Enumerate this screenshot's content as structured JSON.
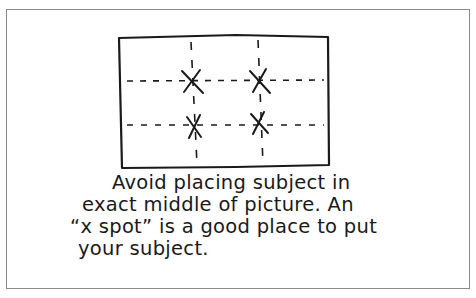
{
  "diagram": {
    "grid_label": "x spot markers",
    "markers": [
      {
        "x": 190,
        "y": 82
      },
      {
        "x": 259,
        "y": 81
      },
      {
        "x": 194,
        "y": 126
      },
      {
        "x": 259,
        "y": 124
      }
    ]
  },
  "caption": {
    "line1": "Avoid placing subject  in",
    "line2": "exact middle of picture. An",
    "line3": "“x spot” is a good place to put",
    "line4": "your subject."
  },
  "colors": {
    "ink": "#1a1a1a",
    "frame": "#8a8a8a"
  }
}
